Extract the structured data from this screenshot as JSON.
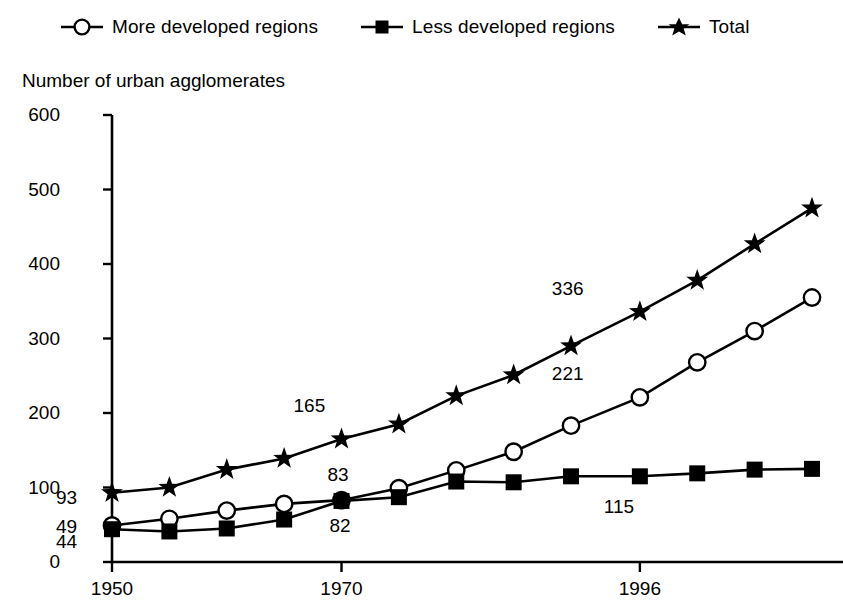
{
  "legend": {
    "items": [
      {
        "label": "More developed regions",
        "marker": "open-circle-marker",
        "color": "#000000"
      },
      {
        "label": "Less developed regions",
        "marker": "filled-square-marker",
        "color": "#000000"
      },
      {
        "label": "Total",
        "marker": "filled-star-marker",
        "color": "#000000"
      }
    ]
  },
  "axis_title": "Number of urban agglomerates",
  "chart_data": {
    "type": "line",
    "title": "",
    "subtitle": "",
    "xlabel": "",
    "ylabel": "Number of urban agglomerates",
    "grid": false,
    "legend_position": "top",
    "xlim": [
      1950,
      2011
    ],
    "ylim": [
      0,
      600
    ],
    "yticks": [
      0,
      100,
      200,
      300,
      400,
      500,
      600
    ],
    "ytick_labels": [
      "0",
      "100",
      "200",
      "300",
      "400",
      "500",
      "600"
    ],
    "xticks": [
      1950,
      1970,
      1996
    ],
    "xtick_labels": [
      "1950",
      "1970",
      "1996"
    ],
    "x": [
      1950,
      1955,
      1960,
      1965,
      1970,
      1975,
      1980,
      1985,
      1990,
      1996,
      2001,
      2006,
      2011
    ],
    "series": [
      {
        "name": "More developed regions",
        "marker": "open-circle-marker",
        "values": [
          49,
          58,
          69,
          78,
          83,
          99,
          123,
          148,
          183,
          221,
          268,
          310,
          355
        ]
      },
      {
        "name": "Less developed regions",
        "marker": "filled-square-marker",
        "values": [
          44,
          41,
          45,
          57,
          82,
          87,
          108,
          107,
          115,
          115,
          119,
          124,
          125
        ]
      },
      {
        "name": "Total",
        "marker": "filled-star-marker",
        "values": [
          93,
          100,
          124,
          139,
          165,
          185,
          223,
          251,
          290,
          336,
          378,
          427,
          475
        ]
      }
    ],
    "annotations": [
      {
        "text": "93",
        "x": 1950,
        "y": 93,
        "series": "Total",
        "dx": -30,
        "dy": 6
      },
      {
        "text": "49",
        "x": 1950,
        "y": 49,
        "series": "More developed regions",
        "dx": -30,
        "dy": 3
      },
      {
        "text": "44",
        "x": 1950,
        "y": 44,
        "series": "Less developed regions",
        "dx": -30,
        "dy": 14
      },
      {
        "text": "165",
        "x": 1970,
        "y": 165,
        "series": "Total",
        "dx": -22,
        "dy": -32
      },
      {
        "text": "83",
        "x": 1970,
        "y": 83,
        "series": "More developed regions",
        "dx": 12,
        "dy": -24
      },
      {
        "text": "82",
        "x": 1970,
        "y": 82,
        "series": "Less developed regions",
        "dx": 14,
        "dy": 26
      },
      {
        "text": "336",
        "x": 1996,
        "y": 336,
        "series": "Total",
        "dx": -62,
        "dy": -22
      },
      {
        "text": "221",
        "x": 1996,
        "y": 221,
        "series": "More developed regions",
        "dx": -62,
        "dy": -22
      },
      {
        "text": "115",
        "x": 1996,
        "y": 115,
        "series": "Less developed regions",
        "dx": -10,
        "dy": 32
      }
    ]
  }
}
